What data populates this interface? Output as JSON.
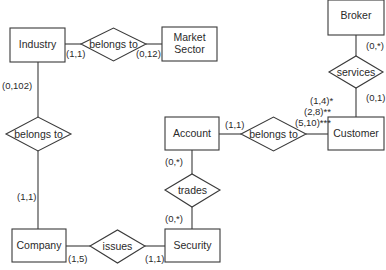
{
  "entities": {
    "industry": "Industry",
    "market_sector_line1": "Market",
    "market_sector_line2": "Sector",
    "broker": "Broker",
    "account": "Account",
    "customer": "Customer",
    "company": "Company",
    "security": "Security"
  },
  "relationships": {
    "industry_market_sector": "belongs to",
    "company_industry": "belongs to",
    "account_customer": "belongs to",
    "broker_customer": "services",
    "account_security": "trades",
    "company_security": "issues"
  },
  "cardinalities": {
    "industry_to_market_rel": "(1,1)",
    "market_sector_to_rel": "(0,12)",
    "industry_to_company_rel": "(0,102)",
    "company_to_industry_rel": "(1,1)",
    "broker_to_services": "(0,*)",
    "customer_to_services": "(0,1)",
    "account_to_customer_rel": "(1,1)",
    "customer_to_account_rel_1": "(1,4)*",
    "customer_to_account_rel_2": "(2,8)**",
    "customer_to_account_rel_3": "(5,10)***",
    "account_to_trades": "(0,*)",
    "security_to_trades": "(0,*)",
    "company_to_issues": "(1,5)",
    "security_to_issues": "(1,1)"
  }
}
